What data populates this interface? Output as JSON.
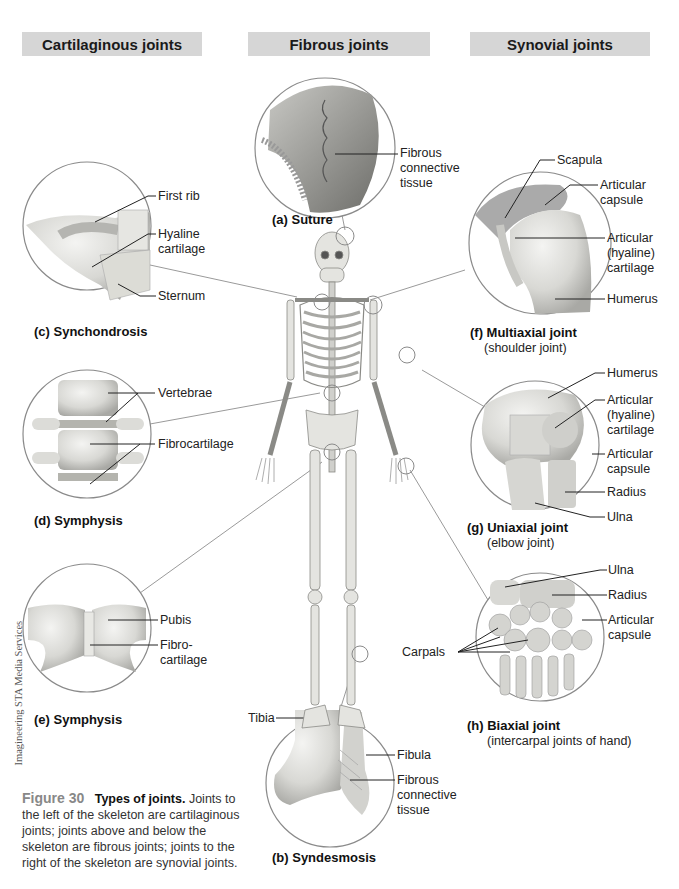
{
  "headers": {
    "cartilaginous": "Cartilaginous joints",
    "fibrous": "Fibrous joints",
    "synovial": "Synovial joints"
  },
  "colors": {
    "header_bg": "#d6d6d6",
    "leader_line": "#9a9a9a",
    "figure_number": "#888888"
  },
  "panels": {
    "a": {
      "caption": "(a) Suture",
      "labels": [
        "Fibrous connective tissue"
      ]
    },
    "b": {
      "caption": "(b) Syndesmosis",
      "labels": [
        "Tibia",
        "Fibula",
        "Fibrous connective tissue"
      ]
    },
    "c": {
      "caption": "(c) Synchondrosis",
      "labels": [
        "First rib",
        "Hyaline cartilage",
        "Sternum"
      ]
    },
    "d": {
      "caption": "(d) Symphysis",
      "labels": [
        "Vertebrae",
        "Fibrocartilage"
      ]
    },
    "e": {
      "caption": "(e) Symphysis",
      "labels": [
        "Pubis",
        "Fibro-cartilage"
      ]
    },
    "f": {
      "caption": "(f) Multiaxial joint",
      "subcaption": "(shoulder joint)",
      "labels": [
        "Scapula",
        "Articular capsule",
        "Articular (hyaline) cartilage",
        "Humerus"
      ]
    },
    "g": {
      "caption": "(g) Uniaxial joint",
      "subcaption": "(elbow joint)",
      "labels": [
        "Humerus",
        "Articular (hyaline) cartilage",
        "Articular capsule",
        "Radius",
        "Ulna"
      ]
    },
    "h": {
      "caption": "(h) Biaxial joint",
      "subcaption": "(intercarpal joints of hand)",
      "labels": [
        "Ulna",
        "Radius",
        "Articular capsule",
        "Carpals"
      ]
    }
  },
  "label_lines": {
    "a_fct1": "Fibrous",
    "a_fct2": "connective",
    "a_fct3": "tissue",
    "b_tibia": "Tibia",
    "b_fibula": "Fibula",
    "b_fct1": "Fibrous",
    "b_fct2": "connective",
    "b_fct3": "tissue",
    "c_rib": "First rib",
    "c_hy1": "Hyaline",
    "c_hy2": "cartilage",
    "c_sternum": "Sternum",
    "d_vert": "Vertebrae",
    "d_fibro": "Fibrocartilage",
    "e_pubis": "Pubis",
    "e_fc1": "Fibro-",
    "e_fc2": "cartilage",
    "f_scapula": "Scapula",
    "f_ac1": "Articular",
    "f_ac2": "capsule",
    "f_ah1": "Articular",
    "f_ah2": "(hyaline)",
    "f_ah3": "cartilage",
    "f_humerus": "Humerus",
    "g_humerus": "Humerus",
    "g_ah1": "Articular",
    "g_ah2": "(hyaline)",
    "g_ah3": "cartilage",
    "g_ac1": "Articular",
    "g_ac2": "capsule",
    "g_radius": "Radius",
    "g_ulna": "Ulna",
    "h_ulna": "Ulna",
    "h_radius": "Radius",
    "h_ac1": "Articular",
    "h_ac2": "capsule",
    "h_carpals": "Carpals"
  },
  "credit": "Imagineering STA Media Services",
  "figure_caption": {
    "number": "Figure 30",
    "title": "Types of joints.",
    "text": "Joints to the left of the skeleton are cartilaginous joints; joints above and below the skeleton are fibrous joints; joints to the right of the skeleton are synovial joints."
  }
}
